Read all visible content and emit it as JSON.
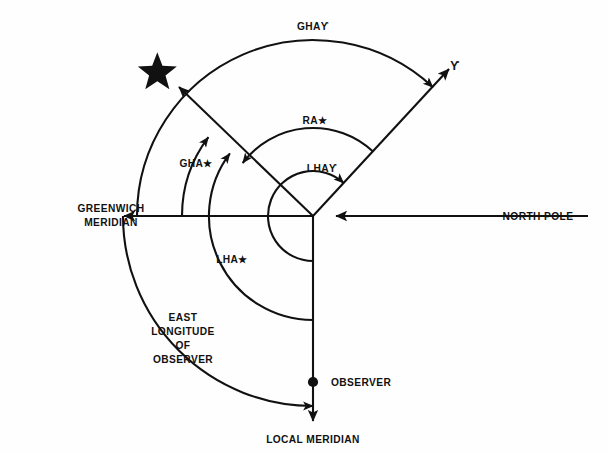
{
  "diagram": {
    "background_color": "#ffffff",
    "line_color": "#111111",
    "labels": {
      "gha_aries": "GHAϒ",
      "gha_star": "GHA★",
      "ra_star": "RA★",
      "lha_aries": "LHAϒ",
      "lha_star": "LHA★",
      "greenwich_meridian_line1": "GREENWICH",
      "greenwich_meridian_line2": "MERIDIAN",
      "north_pole": "NORTH POLE",
      "east_longitude_line1": "EAST",
      "east_longitude_line2": "LONGITUDE",
      "east_longitude_line3": "OF",
      "east_longitude_line4": "OBSERVER",
      "observer": "OBSERVER",
      "local_meridian": "LOCAL MERIDIAN",
      "aries_symbol": "ϒ",
      "star_symbol": "★"
    },
    "icons": {
      "star": "star-icon",
      "aries": "aries-icon",
      "observer_dot": "observer-dot-icon"
    },
    "geometry": {
      "center_x": 313,
      "center_y": 216,
      "greenwich_ray_angle_deg": 180,
      "north_pole_ray_angle_deg": 0,
      "local_meridian_ray_angle_deg": 270,
      "star_ray_angle_deg": 143,
      "aries_ray_angle_deg": 47,
      "arc_radius_gha_aries": 176,
      "arc_radius_gha_star": 131,
      "arc_radius_ra_star": 88,
      "arc_radius_lha_aries": 45,
      "arc_radius_lha_star": 104,
      "arc_radius_east_longitude": 190
    }
  }
}
